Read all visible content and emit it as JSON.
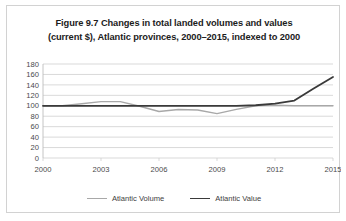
{
  "figure": {
    "title_line1": "Figure 9.7 Changes in total landed volumes and values",
    "title_line2": "(current $), Atlantic provinces, 2000–2015, indexed to 2000"
  },
  "legend": {
    "position": "bottom-center",
    "items": [
      {
        "label": "Atlantic Volume",
        "color": "#a8a8a8"
      },
      {
        "label": "Atlantic Value",
        "color": "#3a3a3a"
      }
    ]
  },
  "axis": {
    "y_ticks": [
      "0",
      "20",
      "40",
      "60",
      "80",
      "100",
      "120",
      "140",
      "160",
      "180"
    ],
    "x_ticks": [
      "2000",
      "2003",
      "2006",
      "2009",
      "2012",
      "2015"
    ]
  },
  "chart_data": {
    "type": "line",
    "title": "Figure 9.7 Changes in total landed volumes and values (current $), Atlantic provinces, 2000–2015, indexed to 2000",
    "xlabel": "",
    "ylabel": "",
    "xlim": [
      2000,
      2015
    ],
    "ylim": [
      0,
      180
    ],
    "ytick_step": 20,
    "grid": true,
    "legend_position": "bottom-center",
    "x": [
      2000,
      2001,
      2002,
      2003,
      2004,
      2005,
      2006,
      2007,
      2008,
      2009,
      2010,
      2011,
      2012,
      2013,
      2014,
      2015
    ],
    "series": [
      {
        "name": "Atlantic Volume",
        "color": "#a8a8a8",
        "values": [
          100,
          100,
          104,
          108,
          108,
          99,
          89,
          93,
          92,
          85,
          93,
          100,
          101,
          100,
          100,
          100
        ]
      },
      {
        "name": "Atlantic Value",
        "color": "#3a3a3a",
        "values": [
          100,
          100,
          100,
          100,
          100,
          100,
          100,
          100,
          100,
          100,
          100,
          101,
          104,
          110,
          133,
          155
        ]
      }
    ]
  }
}
